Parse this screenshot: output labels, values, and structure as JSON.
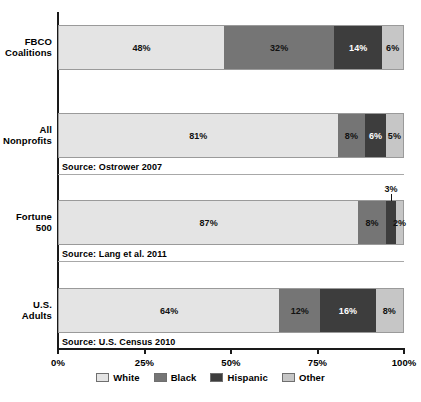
{
  "chart_data": {
    "type": "bar",
    "orientation": "horizontal",
    "stacked": true,
    "title": "",
    "xlabel": "",
    "ylabel": "",
    "xlim": [
      0,
      100
    ],
    "grid": false,
    "legend_position": "bottom-center",
    "categories": [
      "FBCO Coalitions",
      "All Nonprofits",
      "Fortune 500",
      "U.S. Adults"
    ],
    "series": [
      {
        "name": "White",
        "color": "#e4e4e4",
        "values": [
          48,
          81,
          87,
          64
        ]
      },
      {
        "name": "Black",
        "color": "#757575",
        "values": [
          32,
          8,
          8,
          12
        ]
      },
      {
        "name": "Hispanic",
        "color": "#3d3d3d",
        "values": [
          14,
          6,
          3,
          16
        ]
      },
      {
        "name": "Other",
        "color": "#c6c6c6",
        "values": [
          6,
          5,
          2,
          8
        ]
      }
    ],
    "tick_labels": [
      "0%",
      "25%",
      "50%",
      "75%",
      "100%"
    ],
    "tick_values": [
      0,
      25,
      50,
      75,
      100
    ],
    "annotations": [
      "Source: Ostrower 2007",
      "Source: Lang et al. 2011",
      "Source: U.S. Census 2010"
    ]
  },
  "rows": [
    {
      "label_line1": "FBCO",
      "label_line2": "Coalitions",
      "source": "",
      "segments": [
        {
          "key": "white",
          "label": "48%",
          "value": 48,
          "callout": false
        },
        {
          "key": "black",
          "label": "32%",
          "value": 32,
          "callout": false
        },
        {
          "key": "hispanic",
          "label": "14%",
          "value": 14,
          "callout": false
        },
        {
          "key": "other",
          "label": "6%",
          "value": 6,
          "callout": false
        }
      ]
    },
    {
      "label_line1": "All",
      "label_line2": "Nonprofits",
      "source": "Source: Ostrower 2007",
      "segments": [
        {
          "key": "white",
          "label": "81%",
          "value": 81,
          "callout": false
        },
        {
          "key": "black",
          "label": "8%",
          "value": 8,
          "callout": false
        },
        {
          "key": "hispanic",
          "label": "6%",
          "value": 6,
          "callout": false
        },
        {
          "key": "other",
          "label": "5%",
          "value": 5,
          "callout": false
        }
      ]
    },
    {
      "label_line1": "Fortune",
      "label_line2": "500",
      "source": "Source: Lang et al. 2011",
      "segments": [
        {
          "key": "white",
          "label": "87%",
          "value": 87,
          "callout": false
        },
        {
          "key": "black",
          "label": "8%",
          "value": 8,
          "callout": false
        },
        {
          "key": "hispanic",
          "label": "3%",
          "value": 3,
          "callout": true
        },
        {
          "key": "other",
          "label": "2%",
          "value": 2,
          "callout": false
        }
      ]
    },
    {
      "label_line1": "U.S.",
      "label_line2": "Adults",
      "source": "Source: U.S. Census 2010",
      "segments": [
        {
          "key": "white",
          "label": "64%",
          "value": 64,
          "callout": false
        },
        {
          "key": "black",
          "label": "12%",
          "value": 12,
          "callout": false
        },
        {
          "key": "hispanic",
          "label": "16%",
          "value": 16,
          "callout": false
        },
        {
          "key": "other",
          "label": "8%",
          "value": 8,
          "callout": false
        }
      ]
    }
  ],
  "axis": {
    "ticks": [
      {
        "label": "0%",
        "value": 0
      },
      {
        "label": "25%",
        "value": 25
      },
      {
        "label": "50%",
        "value": 50
      },
      {
        "label": "75%",
        "value": 75
      },
      {
        "label": "100%",
        "value": 100
      }
    ]
  },
  "legend": {
    "items": [
      {
        "key": "white",
        "label": "White"
      },
      {
        "key": "black",
        "label": "Black"
      },
      {
        "key": "hispanic",
        "label": "Hispanic"
      },
      {
        "key": "other",
        "label": "Other"
      }
    ]
  },
  "caption": {
    "text": ""
  }
}
